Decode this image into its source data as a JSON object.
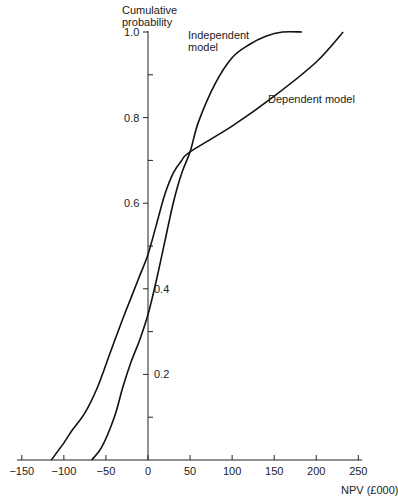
{
  "chart_data": {
    "type": "line",
    "title": "",
    "ylabel": "Cumulative probability",
    "xlabel": "NPV (£000)",
    "xlim": [
      -150,
      250
    ],
    "ylim": [
      0,
      1.0
    ],
    "x_ticks": [
      -150,
      -100,
      -50,
      0,
      50,
      100,
      150,
      200,
      250
    ],
    "x_tick_labels": [
      "−150",
      "−100",
      "−50",
      "0",
      "50",
      "100",
      "150",
      "200",
      "250"
    ],
    "y_ticks": [
      0.2,
      0.4,
      0.6,
      0.8,
      1.0
    ],
    "y_tick_labels": [
      "0.2",
      "0.4",
      "0.6",
      "0.8",
      "1.0"
    ],
    "y_minor_ticks": [
      0.1,
      0.3,
      0.5,
      0.7,
      0.9
    ],
    "grid": false,
    "legend": "inline annotations",
    "series": [
      {
        "name": "Independent model",
        "label_lines": [
          "Independent",
          "model"
        ],
        "x": [
          -67,
          -55,
          -40,
          -30,
          -20,
          -10,
          0,
          10,
          20,
          30,
          40,
          50,
          60,
          80,
          100,
          120,
          140,
          160,
          183
        ],
        "y": [
          0.0,
          0.03,
          0.1,
          0.17,
          0.23,
          0.28,
          0.34,
          0.42,
          0.51,
          0.6,
          0.67,
          0.72,
          0.79,
          0.88,
          0.94,
          0.97,
          0.99,
          1.0,
          1.0
        ]
      },
      {
        "name": "Dependent model",
        "label_lines": [
          "Dependent model"
        ],
        "x": [
          -115,
          -100,
          -90,
          -75,
          -60,
          -45,
          -30,
          -20,
          -10,
          0,
          10,
          20,
          30,
          40,
          50,
          100,
          150,
          200,
          232
        ],
        "y": [
          0.0,
          0.04,
          0.07,
          0.11,
          0.17,
          0.25,
          0.33,
          0.38,
          0.43,
          0.48,
          0.55,
          0.62,
          0.67,
          0.7,
          0.72,
          0.78,
          0.85,
          0.93,
          1.0
        ]
      }
    ],
    "annotations": [
      {
        "text": "Independent model",
        "near": [
          60,
          0.98
        ]
      },
      {
        "text": "Dependent model",
        "near": [
          140,
          0.82
        ]
      }
    ]
  },
  "labels": {
    "ylabel_line1": "Cumulative",
    "ylabel_line2": "probability",
    "xlabel": "NPV (£000)",
    "independent_line1": "Independent",
    "independent_line2": "model",
    "dependent": "Dependent model"
  }
}
